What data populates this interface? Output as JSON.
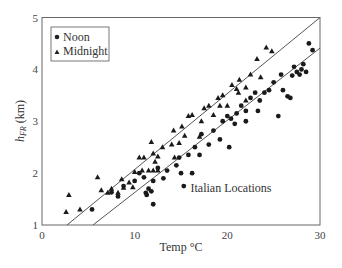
{
  "chart_data": {
    "type": "scatter",
    "title": "",
    "xlabel": "Temp °C",
    "ylabel": "h_FR (km)",
    "ylabel_main": "h",
    "ylabel_sub": "FR",
    "ylabel_unit": " (km)",
    "xlim": [
      0,
      30
    ],
    "ylim": [
      1,
      5
    ],
    "xticks": [
      0,
      10,
      20,
      30
    ],
    "yticks": [
      1,
      2,
      3,
      4,
      5
    ],
    "grid": false,
    "legend_position": "upper left",
    "annotation": "Italian Locations",
    "series": [
      {
        "name": "Noon",
        "marker": "circle",
        "points": [
          [
            5.4,
            1.3
          ],
          [
            7.5,
            1.63
          ],
          [
            8.2,
            1.55
          ],
          [
            8.8,
            1.75
          ],
          [
            10.0,
            1.85
          ],
          [
            10.5,
            2.0
          ],
          [
            11.0,
            1.92
          ],
          [
            11.2,
            1.62
          ],
          [
            11.3,
            1.58
          ],
          [
            11.5,
            1.7
          ],
          [
            11.8,
            1.65
          ],
          [
            12.0,
            1.4
          ],
          [
            12.0,
            1.85
          ],
          [
            12.5,
            2.1
          ],
          [
            13.1,
            1.9
          ],
          [
            13.5,
            2.05
          ],
          [
            14.5,
            2.15
          ],
          [
            14.8,
            2.3
          ],
          [
            15.0,
            2.0
          ],
          [
            15.3,
            1.75
          ],
          [
            15.8,
            2.35
          ],
          [
            16.5,
            2.5
          ],
          [
            17.0,
            2.35
          ],
          [
            16.2,
            2.0
          ],
          [
            17.2,
            2.75
          ],
          [
            18.0,
            2.55
          ],
          [
            18.5,
            2.82
          ],
          [
            19.2,
            2.65
          ],
          [
            19.5,
            3.0
          ],
          [
            20.0,
            3.1
          ],
          [
            20.2,
            2.5
          ],
          [
            20.4,
            3.05
          ],
          [
            20.8,
            2.95
          ],
          [
            21.0,
            3.15
          ],
          [
            21.5,
            3.3
          ],
          [
            22.0,
            3.2
          ],
          [
            22.0,
            3.0
          ],
          [
            22.5,
            3.45
          ],
          [
            23.3,
            3.2
          ],
          [
            23.5,
            3.4
          ],
          [
            23.0,
            3.55
          ],
          [
            24.0,
            3.55
          ],
          [
            24.5,
            3.6
          ],
          [
            25.0,
            3.75
          ],
          [
            25.5,
            3.1
          ],
          [
            25.8,
            3.9
          ],
          [
            26.0,
            3.6
          ],
          [
            26.5,
            3.48
          ],
          [
            26.8,
            3.45
          ],
          [
            27.0,
            3.88
          ],
          [
            27.2,
            4.05
          ],
          [
            27.5,
            3.95
          ],
          [
            27.8,
            3.9
          ],
          [
            28.0,
            4.0
          ],
          [
            28.2,
            4.1
          ],
          [
            28.5,
            3.95
          ],
          [
            28.8,
            4.5
          ],
          [
            29.2,
            4.37
          ]
        ]
      },
      {
        "name": "Midnight",
        "marker": "triangle",
        "points": [
          [
            2.6,
            1.25
          ],
          [
            2.9,
            1.58
          ],
          [
            4.1,
            1.3
          ],
          [
            6.0,
            1.92
          ],
          [
            6.4,
            1.67
          ],
          [
            7.1,
            1.62
          ],
          [
            7.5,
            1.7
          ],
          [
            8.2,
            1.62
          ],
          [
            8.6,
            1.88
          ],
          [
            8.8,
            1.72
          ],
          [
            9.4,
            1.82
          ],
          [
            9.8,
            1.73
          ],
          [
            10.0,
            2.02
          ],
          [
            10.5,
            2.3
          ],
          [
            10.8,
            2.05
          ],
          [
            11.0,
            2.3
          ],
          [
            11.5,
            2.05
          ],
          [
            11.8,
            2.6
          ],
          [
            12.0,
            2.05
          ],
          [
            12.2,
            2.22
          ],
          [
            12.5,
            2.32
          ],
          [
            12.0,
            2.38
          ],
          [
            13.0,
            2.5
          ],
          [
            12.5,
            2.05
          ],
          [
            14.0,
            2.55
          ],
          [
            14.3,
            2.3
          ],
          [
            14.8,
            2.58
          ],
          [
            14.2,
            2.82
          ],
          [
            15.1,
            2.9
          ],
          [
            15.4,
            2.72
          ],
          [
            15.8,
            3.1
          ],
          [
            16.2,
            3.12
          ],
          [
            17.0,
            2.7
          ],
          [
            17.2,
            3.0
          ],
          [
            17.5,
            3.25
          ],
          [
            18.0,
            3.3
          ],
          [
            18.5,
            3.12
          ],
          [
            19.0,
            3.45
          ],
          [
            19.5,
            3.5
          ],
          [
            19.2,
            3.3
          ],
          [
            20.0,
            3.3
          ],
          [
            20.5,
            3.7
          ],
          [
            21.2,
            3.55
          ],
          [
            21.3,
            3.8
          ],
          [
            22.0,
            3.4
          ],
          [
            22.5,
            3.9
          ],
          [
            23.2,
            4.2
          ],
          [
            23.6,
            3.85
          ],
          [
            24.2,
            4.42
          ],
          [
            24.8,
            4.35
          ],
          [
            22.0,
            3.65
          ],
          [
            21.0,
            3.62
          ]
        ]
      }
    ],
    "fit_lines": [
      {
        "name": "Midnight fit",
        "from": [
          2.7,
          1.0
        ],
        "to": [
          30.0,
          5.0
        ]
      },
      {
        "name": "Noon fit",
        "from": [
          5.5,
          1.0
        ],
        "to": [
          30.0,
          4.41
        ]
      }
    ]
  },
  "legend": {
    "items": [
      {
        "label": "Noon",
        "marker": "circle"
      },
      {
        "label": "Midnight",
        "marker": "triangle"
      }
    ]
  }
}
